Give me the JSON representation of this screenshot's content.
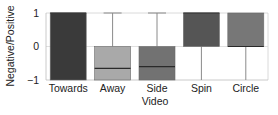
{
  "chart_data": {
    "type": "box",
    "title": "",
    "xlabel": "Video",
    "ylabel": "Negative/Positive",
    "ylim": [
      -1,
      1
    ],
    "yticks": [
      -1,
      0,
      1
    ],
    "ytick_labels": [
      "−1",
      "0",
      "1"
    ],
    "grid": false,
    "legend": null,
    "categories": [
      "Towards",
      "Away",
      "Side",
      "Spin",
      "Circle"
    ],
    "boxes": [
      {
        "label": "Towards",
        "whisker_low": -1,
        "q1": -1,
        "median": 1,
        "q3": 1,
        "whisker_high": 1,
        "color": "#3a3a3a"
      },
      {
        "label": "Away",
        "whisker_low": -1,
        "q1": -1,
        "median": -0.65,
        "q3": 0,
        "whisker_high": 1,
        "color": "#a9a9a9"
      },
      {
        "label": "Side",
        "whisker_low": -1,
        "q1": -1,
        "median": -0.6,
        "q3": 0,
        "whisker_high": 1,
        "color": "#727272"
      },
      {
        "label": "Spin",
        "whisker_low": -1,
        "q1": 0,
        "median": 1,
        "q3": 1,
        "whisker_high": 1,
        "color": "#555555"
      },
      {
        "label": "Circle",
        "whisker_low": -1,
        "q1": 0,
        "median": 0,
        "q3": 1,
        "whisker_high": 1,
        "color": "#777777"
      }
    ]
  }
}
